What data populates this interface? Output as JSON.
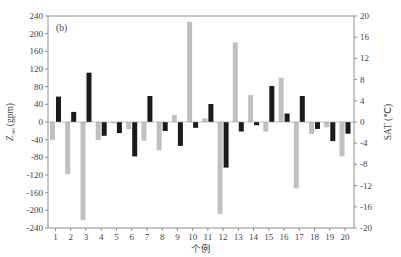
{
  "chart_data": {
    "type": "bar",
    "panel_label": "(b)",
    "title": "",
    "xlabel": "个例",
    "ylabel_left": "Z500 (gpm)",
    "ylabel_left_main": "Z",
    "ylabel_left_sub": "500",
    "ylabel_left_unit": "(gpm)",
    "ylabel_right": "SAT (℃)",
    "ylim_left": [
      -240,
      240
    ],
    "ylim_right": [
      -20,
      20
    ],
    "yticks_left": [
      240,
      200,
      160,
      120,
      80,
      40,
      0,
      -40,
      -80,
      -120,
      -160,
      -200,
      -240
    ],
    "yticks_right": [
      20,
      16,
      12,
      8,
      4,
      0,
      -4,
      -8,
      -12,
      -16,
      -20
    ],
    "categories": [
      "1",
      "2",
      "3",
      "4",
      "5",
      "6",
      "7",
      "8",
      "9",
      "10",
      "11",
      "12",
      "13",
      "14",
      "15",
      "16",
      "17",
      "18",
      "19",
      "20"
    ],
    "grid": false,
    "legend": null,
    "series": [
      {
        "name": "Z500",
        "axis": "left",
        "color": "#c0c0c0",
        "values": [
          -41,
          -118,
          -222,
          -41,
          -3,
          -16,
          -42,
          -64,
          16,
          227,
          8,
          -208,
          180,
          61,
          -22,
          100,
          -150,
          -27,
          -12,
          -78
        ]
      },
      {
        "name": "SAT",
        "axis": "right",
        "color": "#1a1a1a",
        "values": [
          4.8,
          1.9,
          9.3,
          -2.6,
          -2.1,
          -6.5,
          4.9,
          -1.7,
          -4.5,
          -1.1,
          3.4,
          -8.6,
          -1.8,
          -0.6,
          6.8,
          1.6,
          4.9,
          -1.3,
          -3.6,
          -2.2
        ]
      }
    ]
  }
}
